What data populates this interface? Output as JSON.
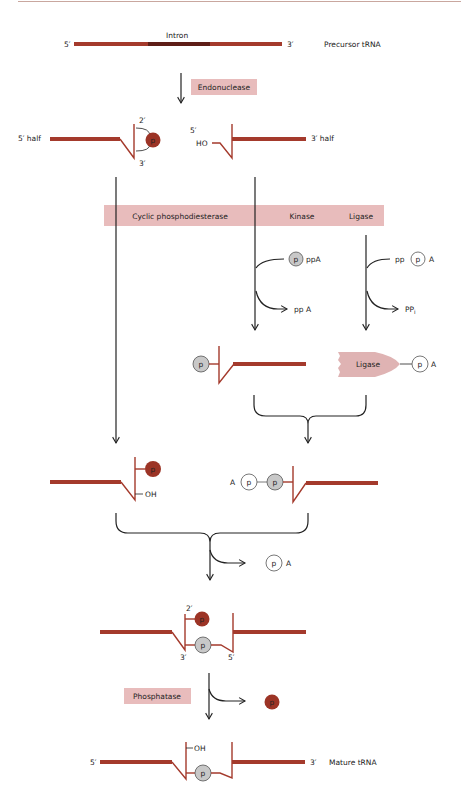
{
  "colors": {
    "strand": "#a43a2c",
    "intron": "#5e1e18",
    "enzyme_box": "#e8bcbc",
    "ligase_shape": "#dfb3b3",
    "phosphate_red": "#9c3426",
    "phosphate_gray": "#c8c8c8",
    "phosphate_white": "#ffffff",
    "top_rule": "#c9a79f"
  },
  "precursor": {
    "intron_label": "Intron",
    "five_prime": "5′",
    "three_prime": "3′",
    "name": "Precursor tRNA"
  },
  "step1": {
    "enzyme": "Endonuclease"
  },
  "halves": {
    "left_label": "5′ half",
    "left_2prime": "2′",
    "left_3prime": "3′",
    "left_p": "p",
    "right_5prime": "5′",
    "right_ho": "HO",
    "right_label": "3′ half"
  },
  "enzyme_bar": {
    "items": [
      "Cyclic phosphodiesterase",
      "Kinase",
      "Ligase"
    ]
  },
  "kinase_branch": {
    "input_p": "p",
    "input_suffix": "ppA",
    "output": "pp A"
  },
  "ligase_branch": {
    "input_prefix": "pp",
    "input_p": "p",
    "input_suffix": "A",
    "output": "PP",
    "output_sub": "i"
  },
  "intermediates": {
    "phospho_p": "p",
    "ligase_label": "Ligase",
    "ligase_p": "p",
    "ligase_a": "A"
  },
  "stage3": {
    "left_p": "p",
    "left_oh": "OH",
    "right_a": "A",
    "right_p1": "p",
    "right_p2": "p"
  },
  "release1": {
    "p": "p",
    "a": "A"
  },
  "joined": {
    "two_prime": "2′",
    "p_red": "p",
    "p_gray": "p",
    "three_prime": "3′",
    "five_prime": "5′"
  },
  "step_final": {
    "enzyme": "Phosphatase",
    "released_p": "p"
  },
  "mature": {
    "five_prime": "5′",
    "oh": "OH",
    "p": "p",
    "three_prime": "3′",
    "name": "Mature tRNA"
  }
}
